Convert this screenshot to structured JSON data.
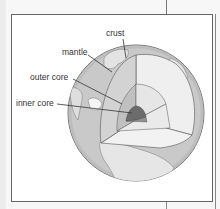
{
  "diagram": {
    "labels": {
      "crust": "crust",
      "mantle": "mantle",
      "outer_core": "outer core",
      "inner_core": "inner core"
    },
    "colors": {
      "background": "#ffffff",
      "frame_border": "#666666",
      "ocean": "#c8c8c8",
      "land": "#e4e4e4",
      "mantle_face": "#d2d2d2",
      "outer_core_face": "#bcbcbc",
      "inner_core": "#6e6e6e",
      "cut_light": "#efefef",
      "leader_line": "#333333"
    }
  }
}
